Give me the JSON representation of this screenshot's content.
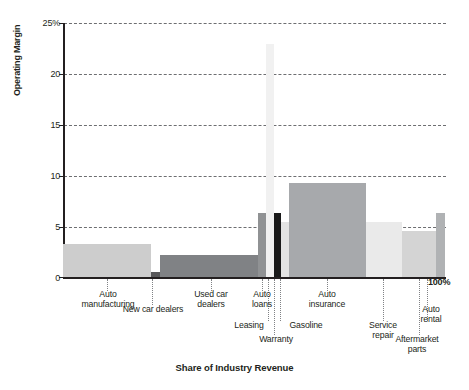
{
  "chart_data": {
    "type": "bar",
    "title": "",
    "subtitle": "",
    "xlabel": "Share of Industry Revenue",
    "ylabel": "Operating Margin",
    "ylim": [
      0,
      25
    ],
    "yticks": [
      "0",
      "5",
      "10",
      "15",
      "20",
      "25%"
    ],
    "ytick_values": [
      0,
      5,
      10,
      15,
      20,
      25
    ],
    "xlim": [
      0,
      100
    ],
    "xlim_label": "100%",
    "grid": "horizontal-dashed",
    "legend": "none",
    "note": "Marimekko / variable-width bar chart: bar width = share of industry revenue (%), bar height = operating margin (%).",
    "categories": [
      {
        "label": "Auto\nmanufacturing",
        "share_start": 0.0,
        "share_end": 23.0,
        "margin": 3.2,
        "color": "#cdcdcd"
      },
      {
        "label": "New car dealers",
        "share_start": 23.0,
        "share_end": 25.2,
        "margin": 0.5,
        "color": "#58585a"
      },
      {
        "label": "Used car\ndealers",
        "share_start": 25.2,
        "share_end": 51.0,
        "margin": 2.2,
        "color": "#808285"
      },
      {
        "label": "Auto\nloans",
        "share_start": 51.0,
        "share_end": 53.0,
        "margin": 6.3,
        "color": "#909294"
      },
      {
        "label": "Leasing",
        "share_start": 53.0,
        "share_end": 55.1,
        "margin": 22.9,
        "color": "#f1f1f1"
      },
      {
        "label": "Warranty",
        "share_start": 55.1,
        "share_end": 56.8,
        "margin": 6.3,
        "color": "#1a1a1a"
      },
      {
        "label": "Gasoline",
        "share_start": 56.8,
        "share_end": 59.0,
        "margin": 5.4,
        "color": "#e3e3e3"
      },
      {
        "label": "Auto\ninsurance",
        "share_start": 59.0,
        "share_end": 79.0,
        "margin": 9.3,
        "color": "#a7a9ac"
      },
      {
        "label": "Service\nrepair",
        "share_start": 79.0,
        "share_end": 88.5,
        "margin": 5.4,
        "color": "#eaeaea"
      },
      {
        "label": "Aftermarket\nparts",
        "share_start": 88.5,
        "share_end": 97.5,
        "margin": 4.5,
        "color": "#d4d4d4"
      },
      {
        "label": "Auto\nrental",
        "share_start": 97.5,
        "share_end": 99.8,
        "margin": 6.3,
        "color": "#b0b2b4"
      }
    ]
  },
  "labels": {
    "auto_manufacturing": "Auto\nmanufacturing",
    "new_car_dealers": "New car dealers",
    "used_car_dealers": "Used car\ndealers",
    "auto_loans": "Auto\nloans",
    "leasing": "Leasing",
    "warranty": "Warranty",
    "gasoline": "Gasoline",
    "auto_insurance": "Auto\ninsurance",
    "service_repair": "Service\nrepair",
    "aftermarket_parts": "Aftermarket\nparts",
    "auto_rental": "Auto\nrental",
    "x_axis_end": "100%"
  },
  "axes": {
    "y_title": "Operating Margin",
    "x_title": "Share of Industry Revenue",
    "y_ticks": [
      "25%",
      "20",
      "15",
      "10",
      "5",
      "0"
    ]
  },
  "colors": {
    "axis": "#231f20",
    "grid": "#6d6e71",
    "leader": "#808285",
    "background": "#ffffff"
  }
}
